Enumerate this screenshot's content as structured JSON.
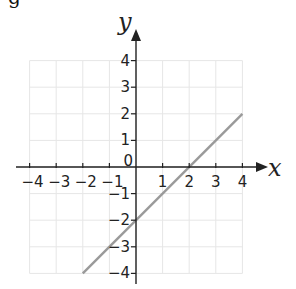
{
  "top_fragment": "g",
  "chart_data": {
    "type": "line",
    "title": "",
    "xlabel": "x",
    "ylabel": "y",
    "xlim": [
      -4,
      4
    ],
    "ylim": [
      -4,
      4
    ],
    "grid": true,
    "x_ticks": [
      -4,
      -3,
      -2,
      -1,
      0,
      1,
      2,
      3,
      4
    ],
    "y_ticks": [
      -4,
      -3,
      -2,
      -1,
      1,
      2,
      3,
      4
    ],
    "x_tick_labels": [
      "−4",
      "−3",
      "−2",
      "−1",
      "0",
      "1",
      "2",
      "3",
      "4"
    ],
    "y_tick_labels": [
      "−4",
      "−3",
      "−2",
      "−1",
      "1",
      "2",
      "3",
      "4"
    ],
    "origin_label": "0",
    "series": [
      {
        "name": "line",
        "equation": "y = x − 2",
        "x": [
          -2,
          4
        ],
        "y": [
          -4,
          2
        ],
        "color": "#9a9a9a"
      }
    ],
    "colors": {
      "grid": "#e6e6e6",
      "axes": "#222222",
      "line": "#9a9a9a"
    }
  }
}
